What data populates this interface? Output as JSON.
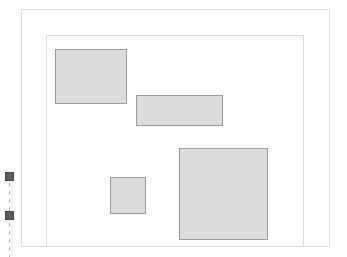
{
  "diagram": {
    "outer_frame": {
      "x": 21,
      "y": 9,
      "w": 309,
      "h": 238,
      "border": "#dcdcdc"
    },
    "inner_frame": {
      "x": 46,
      "y": 35,
      "w": 258,
      "h": 212,
      "border": "#dcdcdc"
    },
    "boxes": [
      {
        "id": "box-1",
        "x": 55,
        "y": 49,
        "w": 72,
        "h": 55
      },
      {
        "id": "box-2",
        "x": 136,
        "y": 95,
        "w": 87,
        "h": 31
      },
      {
        "id": "box-3",
        "x": 110,
        "y": 177,
        "w": 36,
        "h": 37
      },
      {
        "id": "box-4",
        "x": 179,
        "y": 148,
        "w": 89,
        "h": 92
      }
    ],
    "box_fill": "#dddddd",
    "box_border": "#9a9a9a",
    "markers": [
      {
        "id": "marker-1",
        "x": 5,
        "y": 172
      },
      {
        "id": "marker-2",
        "x": 5,
        "y": 211
      }
    ],
    "marker_fill": "#5e5e5e",
    "dashed_line": {
      "x": 9,
      "y_start": 182,
      "y_end": 257,
      "color": "#b5b5b5"
    }
  }
}
